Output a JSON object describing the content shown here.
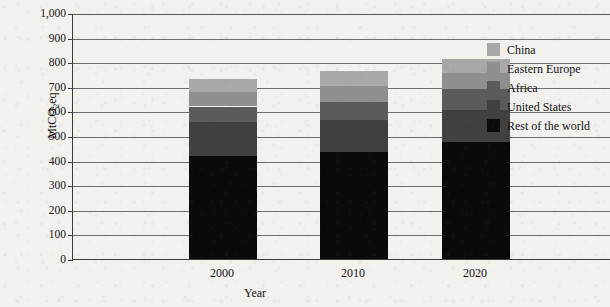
{
  "chart_data": {
    "type": "bar",
    "stacked": true,
    "title": "",
    "xlabel": "Year",
    "ylabel": "MtCO2eq",
    "ylabel_parts": {
      "pre": "MtCO",
      "sub": "2",
      "post": "eq"
    },
    "categories": [
      "2000",
      "2010",
      "2020"
    ],
    "ylim": [
      0,
      1000
    ],
    "ytick_step": 100,
    "ytick_labels": [
      "0",
      "100",
      "200",
      "300",
      "400",
      "500",
      "600",
      "700",
      "800",
      "900",
      "1,000"
    ],
    "ytick_values": [
      0,
      100,
      200,
      300,
      400,
      500,
      600,
      700,
      800,
      900,
      1000
    ],
    "grid": true,
    "legend_position": "right",
    "stack_order_bottom_to_top": [
      "Rest of the world",
      "United States",
      "Africa",
      "Eastern Europe",
      "China"
    ],
    "series": [
      {
        "name": "Rest of the world",
        "color": "#0a0a0a",
        "values": [
          420,
          437,
          477
        ]
      },
      {
        "name": "United States",
        "color": "#404040",
        "values": [
          135,
          128,
          130
        ]
      },
      {
        "name": "Africa",
        "color": "#5b5b5b",
        "values": [
          65,
          75,
          85
        ]
      },
      {
        "name": "Eastern Europe",
        "color": "#8f8f8f",
        "values": [
          60,
          62,
          63
        ]
      },
      {
        "name": "China",
        "color": "#a8a8a8",
        "values": [
          50,
          63,
          60
        ]
      }
    ],
    "totals": [
      730,
      765,
      815
    ],
    "legend_entries": [
      {
        "label": "China",
        "color": "#a8a8a8"
      },
      {
        "label": "Eastern Europe",
        "color": "#8f8f8f"
      },
      {
        "label": "Africa",
        "color": "#5b5b5b"
      },
      {
        "label": "United States",
        "color": "#404040"
      },
      {
        "label": "Rest of the world",
        "color": "#0a0a0a"
      }
    ]
  },
  "colors": {
    "axis": "#3b3b3b",
    "gridline": "#6d6d6d",
    "background": "#f2f1ee",
    "text": "#141414"
  }
}
